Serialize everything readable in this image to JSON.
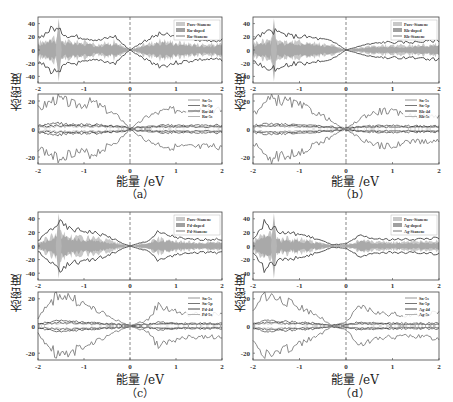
{
  "figure": {
    "ylabel": "态密度",
    "xlabel": "能量 /eV",
    "panels": [
      {
        "id": "a",
        "caption": "（a）",
        "dopant": "Ru",
        "top_legend": [
          "Pure-Stanene",
          "Ru-doped",
          "Ru-Stanene"
        ],
        "bottom_legend": [
          "Sn-5s",
          "Sn-5p",
          "Ru-4d",
          "Ru-5s"
        ]
      },
      {
        "id": "b",
        "caption": "（b）",
        "dopant": "Rh",
        "top_legend": [
          "Pure-Stanene",
          "Rh-doped",
          "Rh-Stanene"
        ],
        "bottom_legend": [
          "Sn-5s",
          "Sn-5p",
          "Rh-4d",
          "Rh-5s"
        ]
      },
      {
        "id": "c",
        "caption": "（c）",
        "dopant": "Pd",
        "top_legend": [
          "Pure-Stanene",
          "Pd-doped",
          "Pd-Stanene"
        ],
        "bottom_legend": [
          "Sn-5s",
          "Sn-5p",
          "Pd-4d",
          "Pd-5s"
        ]
      },
      {
        "id": "d",
        "caption": "（d）",
        "dopant": "Ag",
        "top_legend": [
          "Pure-Stanene",
          "Ag-doped",
          "Ag-Stanene"
        ],
        "bottom_legend": [
          "Sn-5s",
          "Sn-5p",
          "Ag-4d",
          "Ag-5s"
        ]
      }
    ]
  },
  "chart_data": [
    {
      "type": "area",
      "title": "(a) Ru-doped stanene total DOS",
      "xlabel": "能量 /eV",
      "ylabel": "态密度",
      "xlim": [
        -2,
        2
      ],
      "ylim": [
        -50,
        50
      ],
      "xticks": [
        -2,
        -1,
        0,
        1,
        2
      ],
      "yticks": [
        40,
        20,
        0,
        -20,
        -40
      ],
      "fermi_line_x": 0,
      "series": [
        {
          "name": "Pure-Stanene",
          "envelope_max": [
            12,
            45,
            15,
            12,
            8,
            5,
            2,
            0,
            3,
            8,
            12,
            10,
            10
          ]
        },
        {
          "name": "Ru-doped",
          "envelope_max": [
            10,
            40,
            14,
            12,
            8,
            4,
            2,
            0,
            3,
            7,
            10,
            9,
            9
          ]
        },
        {
          "name": "Ru-Stanene",
          "envelope_max": [
            18,
            35,
            22,
            20,
            15,
            22,
            10,
            0,
            15,
            25,
            20,
            15,
            15
          ]
        }
      ],
      "x": [
        -2,
        -1.67,
        -1.33,
        -1,
        -0.67,
        -0.33,
        -0.17,
        0,
        0.33,
        0.67,
        1,
        1.5,
        2
      ]
    },
    {
      "type": "line",
      "title": "(a) Ru-doped projected DOS",
      "xlim": [
        -2,
        2
      ],
      "ylim": [
        -25,
        25
      ],
      "xticks": [
        -2,
        -1,
        0,
        1,
        2
      ],
      "yticks": [
        20,
        0,
        -20
      ],
      "series": [
        {
          "name": "Sn-5s"
        },
        {
          "name": "Sn-5p",
          "envelope_max": [
            15,
            23,
            18,
            20,
            12,
            8,
            0,
            10,
            14,
            15,
            14
          ]
        },
        {
          "name": "Ru-4d"
        },
        {
          "name": "Ru-5s"
        }
      ],
      "x": [
        -2,
        -1.6,
        -1.2,
        -0.8,
        -0.4,
        -0.2,
        0,
        0.4,
        0.8,
        1.4,
        2
      ]
    },
    {
      "type": "area",
      "title": "(b) Rh-doped stanene total DOS",
      "xlim": [
        -2,
        2
      ],
      "ylim": [
        -50,
        50
      ],
      "xticks": [
        -2,
        -1,
        0,
        1,
        2
      ],
      "yticks": [
        40,
        20,
        0,
        -20,
        -40
      ],
      "series": [
        {
          "name": "Pure-Stanene"
        },
        {
          "name": "Rh-doped"
        },
        {
          "name": "Rh-Stanene",
          "envelope_max": [
            18,
            30,
            22,
            20,
            15,
            10,
            0,
            8,
            12,
            12,
            15
          ]
        }
      ],
      "x": [
        -2,
        -1.6,
        -1.2,
        -0.8,
        -0.4,
        -0.2,
        0,
        0.4,
        0.8,
        1.4,
        2
      ]
    },
    {
      "type": "line",
      "title": "(b) Rh-doped projected DOS",
      "xlim": [
        -2,
        2
      ],
      "ylim": [
        -25,
        25
      ],
      "xticks": [
        -2,
        -1,
        0,
        1,
        2
      ],
      "yticks": [
        20,
        0,
        -20
      ],
      "series": [
        {
          "name": "Sn-5s"
        },
        {
          "name": "Sn-5p",
          "envelope_max": [
            12,
            23,
            20,
            15,
            8,
            3,
            0,
            10,
            14,
            10,
            10
          ]
        },
        {
          "name": "Rh-4d"
        },
        {
          "name": "Rh-5s"
        }
      ],
      "x": [
        -2,
        -1.6,
        -1.2,
        -0.8,
        -0.4,
        -0.2,
        0,
        0.4,
        0.8,
        1.4,
        2
      ]
    },
    {
      "type": "area",
      "title": "(c) Pd-doped stanene total DOS",
      "xlim": [
        -2,
        2
      ],
      "ylim": [
        -50,
        50
      ],
      "xticks": [
        -2,
        -1,
        0,
        1,
        2
      ],
      "yticks": [
        40,
        20,
        0,
        -20,
        -40
      ],
      "series": [
        {
          "name": "Pure-Stanene"
        },
        {
          "name": "Pd-doped"
        },
        {
          "name": "Pd-Stanene",
          "envelope_max": [
            8,
            35,
            25,
            22,
            15,
            5,
            0,
            8,
            20,
            10,
            10
          ]
        }
      ],
      "x": [
        -2,
        -1.55,
        -1.3,
        -0.9,
        -0.5,
        -0.2,
        0,
        0.4,
        0.6,
        1.2,
        2
      ]
    },
    {
      "type": "line",
      "title": "(c) Pd-doped projected DOS",
      "xlim": [
        -2,
        2
      ],
      "ylim": [
        -25,
        25
      ],
      "xticks": [
        -2,
        -1,
        0,
        1,
        2
      ],
      "yticks": [
        20,
        0,
        -20
      ],
      "series": [
        {
          "name": "Sn-5s"
        },
        {
          "name": "Sn-5p",
          "envelope_max": [
            6,
            25,
            22,
            15,
            8,
            3,
            0,
            5,
            16,
            9,
            9
          ]
        },
        {
          "name": "Pd-4d"
        },
        {
          "name": "Pd-5s"
        }
      ],
      "x": [
        -2,
        -1.55,
        -1.3,
        -0.9,
        -0.5,
        -0.2,
        0,
        0.4,
        0.6,
        1.2,
        2
      ]
    },
    {
      "type": "area",
      "title": "(d) Ag-doped stanene total DOS",
      "xlim": [
        -2,
        2
      ],
      "ylim": [
        -50,
        50
      ],
      "xticks": [
        -2,
        -1,
        0,
        1,
        2
      ],
      "yticks": [
        40,
        20,
        0,
        -20,
        -40
      ],
      "series": [
        {
          "name": "Pure-Stanene"
        },
        {
          "name": "Ag-doped"
        },
        {
          "name": "Ag-Stanene",
          "envelope_max": [
            12,
            35,
            20,
            18,
            10,
            2,
            3,
            15,
            10,
            10,
            12
          ]
        }
      ],
      "x": [
        -2,
        -1.75,
        -1.4,
        -1,
        -0.6,
        -0.3,
        0,
        0.3,
        0.7,
        1.4,
        2
      ]
    },
    {
      "type": "line",
      "title": "(d) Ag-doped projected DOS",
      "xlim": [
        -2,
        2
      ],
      "ylim": [
        -25,
        25
      ],
      "xticks": [
        -2,
        -1,
        0,
        1,
        2
      ],
      "yticks": [
        20,
        0,
        -20
      ],
      "series": [
        {
          "name": "Sn-5s"
        },
        {
          "name": "Sn-5p",
          "envelope_max": [
            10,
            25,
            20,
            15,
            8,
            0,
            3,
            15,
            10,
            8,
            10
          ]
        },
        {
          "name": "Ag-4d"
        },
        {
          "name": "Ag-5s"
        }
      ],
      "x": [
        -2,
        -1.75,
        -1.4,
        -1,
        -0.6,
        -0.3,
        0,
        0.3,
        0.7,
        1.4,
        2
      ]
    }
  ]
}
